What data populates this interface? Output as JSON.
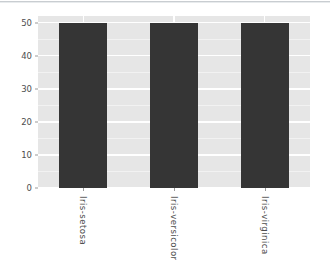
{
  "chart_data": {
    "type": "bar",
    "title": "",
    "subtitle": "",
    "xlabel": "",
    "ylabel": "",
    "categories": [
      "Iris-setosa",
      "Iris-versicolor",
      "Iris-virginica"
    ],
    "values": [
      50,
      50,
      50
    ],
    "series": [
      {
        "name": "count",
        "values": [
          50,
          50,
          50
        ]
      }
    ],
    "ylim": [
      0,
      52
    ],
    "y_ticks": [
      "0",
      "10",
      "20",
      "30",
      "40",
      "50"
    ],
    "y_tick_values": [
      0,
      10,
      20,
      30,
      40,
      50
    ],
    "grid": "horizontal-and-vertical-white-on-gray",
    "legend": "none",
    "x_tick_label_rotation": 90,
    "bar_color": "#353535",
    "panel_background": "#e6e6e6",
    "gridline_color": "#ffffff",
    "tick_label_color": "#4d4d4d",
    "page_background": "#ffffff"
  },
  "figure": {
    "top_rule_color": "#c9cdd1"
  }
}
